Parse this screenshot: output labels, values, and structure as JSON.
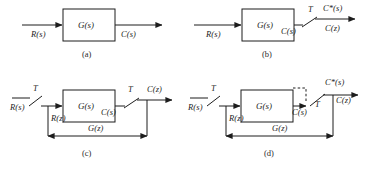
{
  "figure": {
    "line_color": "#1d1d1d",
    "background": "#ffffff"
  },
  "panels": [
    {
      "id": "a",
      "caption": "(a)",
      "block_label": "G(s)",
      "input_label": "R(s)",
      "output_label": "C(s)",
      "has_input_sampler": false,
      "has_output_sampler": false,
      "labels": {
        "sampler_period": "",
        "z_input": "",
        "z_transfer": "",
        "star_output": "",
        "z_output": ""
      }
    },
    {
      "id": "b",
      "caption": "(b)",
      "block_label": "G(s)",
      "input_label": "R(s)",
      "output_label": "C(s)",
      "has_input_sampler": false,
      "has_output_sampler": true,
      "labels": {
        "sampler_period": "T",
        "z_input": "",
        "z_transfer": "",
        "star_output": "C*(s)",
        "z_output": "C(z)"
      }
    },
    {
      "id": "c",
      "caption": "(c)",
      "block_label": "G(s)",
      "input_label": "R(s)",
      "output_label": "C(s)",
      "has_input_sampler": true,
      "has_output_sampler": true,
      "labels": {
        "sampler_period_in": "T",
        "sampler_period_out": "T",
        "z_input": "R(z)",
        "z_transfer": "G(z)",
        "star_output": "",
        "z_output": "C(z)"
      }
    },
    {
      "id": "d",
      "caption": "(d)",
      "block_label": "G(s)",
      "input_label": "R(s)",
      "output_label": "C(s)",
      "has_input_sampler": true,
      "has_output_sampler": true,
      "has_dashed_box": true,
      "labels": {
        "sampler_period_in": "T",
        "sampler_period_out": "T",
        "z_input": "R(z)",
        "z_transfer": "G(z)",
        "star_output": "C*(s)",
        "z_output": "C(z)"
      }
    }
  ],
  "symbols": {
    "star_superscript": "*",
    "laplace_var": "s",
    "z_var": "z",
    "period_symbol": "T"
  }
}
